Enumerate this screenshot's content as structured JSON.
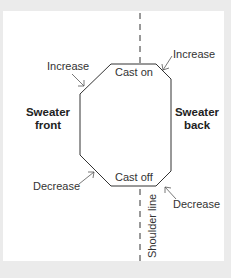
{
  "diagram": {
    "labels": {
      "cast_on": "Cast on",
      "cast_off": "Cast off",
      "increase_left": "Increase",
      "increase_right": "Increase",
      "decrease_left": "Decrease",
      "decrease_right": "Decrease",
      "front_line1": "Sweater",
      "front_line2": "front",
      "back_line1": "Sweater",
      "back_line2": "back",
      "shoulder_line": "Shoulder line"
    },
    "colors": {
      "background": "#ebebeb",
      "panel": "#ffffff",
      "stroke": "#333333"
    }
  }
}
